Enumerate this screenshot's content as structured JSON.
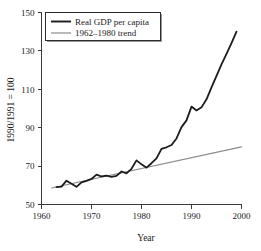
{
  "chart_data": {
    "type": "line",
    "title": "",
    "xlabel": "Year",
    "ylabel": "1990/1991 = 100",
    "xlim": [
      1960,
      2000
    ],
    "ylim": [
      50,
      150
    ],
    "xticks": [
      1960,
      1970,
      1980,
      1990,
      2000
    ],
    "yticks": [
      50,
      70,
      90,
      110,
      130,
      150
    ],
    "grid": false,
    "legend_position": "top-left",
    "series": [
      {
        "name": "Real GDP per capita",
        "color": "#1c1c1c",
        "width": "thick",
        "x": [
          1963,
          1964,
          1965,
          1966,
          1967,
          1968,
          1969,
          1970,
          1971,
          1972,
          1973,
          1974,
          1975,
          1976,
          1977,
          1978,
          1979,
          1980,
          1981,
          1982,
          1983,
          1984,
          1985,
          1986,
          1987,
          1988,
          1989,
          1990,
          1991,
          1992,
          1993,
          1994,
          1995,
          1996,
          1997,
          1998,
          1999
        ],
        "values": [
          59.0,
          59.3,
          62.4,
          60.8,
          59.2,
          61.5,
          62.3,
          63.3,
          65.6,
          64.6,
          65.0,
          64.4,
          64.9,
          67.2,
          66.2,
          68.6,
          73.0,
          70.9,
          69.2,
          71.5,
          74.0,
          79.0,
          79.8,
          81.0,
          84.4,
          90.3,
          93.8,
          101.0,
          99.0,
          100.6,
          104.8,
          111.0,
          117.0,
          123.0,
          128.5,
          134.0,
          140.0
        ]
      },
      {
        "name": "1962–1980 trend",
        "color": "#8c8c8c",
        "width": "thin",
        "x": [
          1962,
          2000
        ],
        "values": [
          58.6,
          80.0
        ]
      }
    ],
    "legend": [
      {
        "label": "Real GDP per capita",
        "style": "thick-black"
      },
      {
        "label": "1962–1980 trend",
        "style": "thin-gray"
      }
    ]
  },
  "axis": {
    "y_title": "1990/1991 = 100",
    "x_title": "Year",
    "y_tick_labels": [
      "50",
      "70",
      "90",
      "110",
      "130",
      "150"
    ],
    "x_tick_labels": [
      "1960",
      "1970",
      "1980",
      "1990",
      "2000"
    ]
  }
}
